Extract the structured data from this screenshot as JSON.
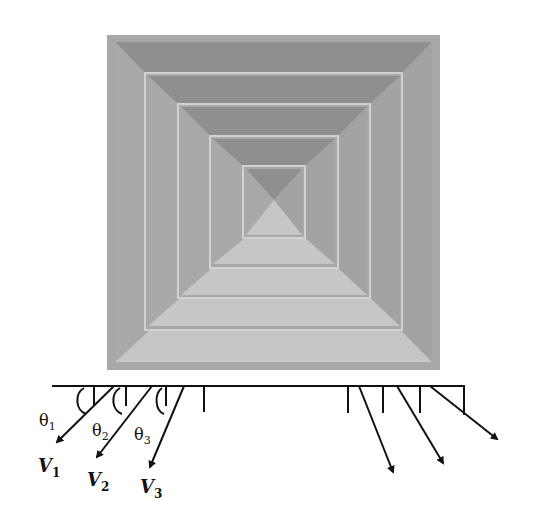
{
  "figure": {
    "colors": {
      "background": "#ffffff",
      "frame": "#a8a8a8",
      "top_face": "#8f8f8f",
      "side_face": "#a9a9a9",
      "bottom_face": "#c6c6c6",
      "ridge": "#d2d2d2",
      "ink": "#111111"
    },
    "diffuser": {
      "rings": 5
    },
    "labels": {
      "theta1": "θ",
      "theta1_sub": "1",
      "theta2": "θ",
      "theta2_sub": "2",
      "theta3": "θ",
      "theta3_sub": "3",
      "v1": "V",
      "v1_sub": "1",
      "v2": "V",
      "v2_sub": "2",
      "v3": "V",
      "v3_sub": "3"
    }
  }
}
